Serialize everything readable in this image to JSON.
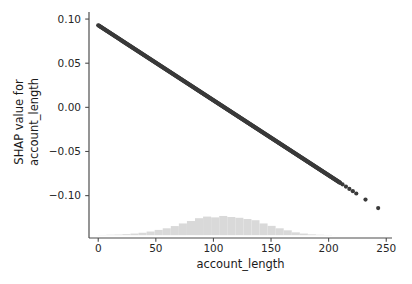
{
  "chart_data": {
    "type": "scatter",
    "title": "",
    "subtitle": "",
    "xlabel": "account_length",
    "ylabel": "SHAP value for account_length",
    "ylabel_lines": [
      "SHAP value for",
      "account_length"
    ],
    "xlim": [
      -8,
      255
    ],
    "ylim": [
      -0.148,
      0.108
    ],
    "xticks": [
      0,
      50,
      100,
      150,
      200,
      250
    ],
    "xticklabels": [
      "0",
      "50",
      "100",
      "150",
      "200",
      "250"
    ],
    "yticks": [
      0.1,
      0.05,
      0.0,
      -0.05,
      -0.1
    ],
    "yticklabels": [
      "0.10",
      "0.05",
      "0.00",
      "−0.05",
      "−0.10"
    ],
    "grid": false,
    "legend": null,
    "point_color": "#3a3a3a",
    "point_size": 2.1,
    "series": [
      {
        "name": "SHAP value for account_length",
        "x": [
          0,
          2,
          4,
          6,
          8,
          10,
          12,
          14,
          16,
          18,
          20,
          22,
          24,
          26,
          28,
          30,
          32,
          34,
          36,
          38,
          40,
          42,
          44,
          46,
          48,
          50,
          52,
          54,
          56,
          58,
          60,
          62,
          64,
          66,
          68,
          70,
          72,
          74,
          76,
          78,
          80,
          82,
          84,
          86,
          88,
          90,
          92,
          94,
          96,
          98,
          100,
          102,
          104,
          106,
          108,
          110,
          112,
          114,
          116,
          118,
          120,
          122,
          124,
          126,
          128,
          130,
          132,
          134,
          136,
          138,
          140,
          142,
          144,
          146,
          148,
          150,
          152,
          154,
          156,
          158,
          160,
          162,
          164,
          166,
          168,
          170,
          172,
          174,
          176,
          178,
          180,
          182,
          184,
          186,
          188,
          190,
          192,
          194,
          196,
          198,
          200,
          202,
          204,
          206,
          208,
          210,
          212,
          215,
          218,
          221,
          224,
          232,
          243
        ],
        "y": [
          0.093,
          0.0913,
          0.0896,
          0.0879,
          0.0862,
          0.0845,
          0.0828,
          0.0811,
          0.0794,
          0.0777,
          0.076,
          0.0743,
          0.0726,
          0.0709,
          0.0692,
          0.0675,
          0.0658,
          0.0641,
          0.0624,
          0.0607,
          0.059,
          0.0573,
          0.0556,
          0.0539,
          0.0522,
          0.0505,
          0.0488,
          0.0471,
          0.0454,
          0.0437,
          0.042,
          0.0403,
          0.0386,
          0.0369,
          0.0352,
          0.0335,
          0.0318,
          0.0301,
          0.0284,
          0.0267,
          0.025,
          0.0233,
          0.0216,
          0.0199,
          0.0182,
          0.0165,
          0.0148,
          0.0131,
          0.0114,
          0.0097,
          0.008,
          0.0063,
          0.0046,
          0.0029,
          0.0012,
          -0.0005,
          -0.0022,
          -0.0039,
          -0.0056,
          -0.0073,
          -0.009,
          -0.0107,
          -0.0124,
          -0.0141,
          -0.0158,
          -0.0175,
          -0.0192,
          -0.0209,
          -0.0226,
          -0.0243,
          -0.026,
          -0.0277,
          -0.0294,
          -0.0311,
          -0.0328,
          -0.0345,
          -0.0362,
          -0.0379,
          -0.0396,
          -0.0413,
          -0.043,
          -0.0447,
          -0.0464,
          -0.0481,
          -0.0498,
          -0.0515,
          -0.0532,
          -0.0549,
          -0.0566,
          -0.0583,
          -0.06,
          -0.0617,
          -0.0634,
          -0.0651,
          -0.0668,
          -0.0685,
          -0.0702,
          -0.0719,
          -0.0736,
          -0.0753,
          -0.077,
          -0.0787,
          -0.0804,
          -0.0821,
          -0.0838,
          -0.0855,
          -0.0872,
          -0.0898,
          -0.0924,
          -0.095,
          -0.0976,
          -0.1045,
          -0.1141
        ]
      }
    ],
    "histogram": {
      "name": "account_length distribution",
      "color": "#d9d9d9",
      "bin_edges": [
        0,
        7,
        14,
        21,
        28,
        35,
        42,
        49,
        56,
        63,
        70,
        77,
        84,
        91,
        98,
        105,
        112,
        119,
        126,
        133,
        140,
        147,
        154,
        161,
        168,
        175,
        182,
        189,
        196,
        203
      ],
      "counts": [
        1,
        2,
        3,
        5,
        8,
        12,
        18,
        26,
        34,
        45,
        58,
        70,
        84,
        92,
        88,
        95,
        90,
        86,
        80,
        74,
        58,
        46,
        34,
        24,
        14,
        8,
        4,
        2,
        1
      ],
      "baseline_y": -0.1448,
      "max_height_frac": 0.085
    }
  },
  "axes": {
    "spine_color": "#4d4d4d",
    "tick_color": "#4d4d4d",
    "background": "#ffffff"
  }
}
